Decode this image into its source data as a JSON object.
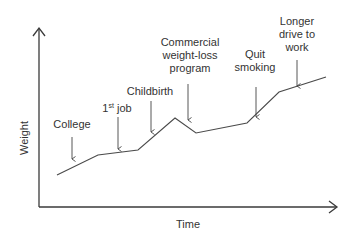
{
  "chart_data": {
    "type": "line",
    "title": "",
    "xlabel": "Time",
    "ylabel": "Weight",
    "grid": false,
    "legend": null,
    "axis_ticks": false,
    "colors": {
      "line": "#4a4a4a",
      "axis": "#3a3a3a",
      "text": "#333333"
    },
    "points": [
      {
        "x": 57,
        "y": 175
      },
      {
        "x": 98,
        "y": 155
      },
      {
        "x": 138,
        "y": 150
      },
      {
        "x": 175,
        "y": 118
      },
      {
        "x": 196,
        "y": 133
      },
      {
        "x": 247,
        "y": 123
      },
      {
        "x": 279,
        "y": 92
      },
      {
        "x": 326,
        "y": 77
      }
    ],
    "annotations": [
      {
        "id": "college",
        "lines": [
          "College"
        ],
        "text_x": 72,
        "text_y": [
          128
        ],
        "arrow_x": 72,
        "arrow_y1": 137,
        "arrow_y2": 160
      },
      {
        "id": "first-job",
        "lines": [
          "1",
          "st",
          " job"
        ],
        "text_x": 117,
        "text_y": [
          112
        ],
        "arrow_x": 118,
        "arrow_y1": 117,
        "arrow_y2": 150,
        "superscript": true
      },
      {
        "id": "childbirth",
        "lines": [
          "Childbirth"
        ],
        "text_x": 150,
        "text_y": [
          95
        ],
        "arrow_x": 151,
        "arrow_y1": 101,
        "arrow_y2": 133
      },
      {
        "id": "commercial-weight-loss",
        "lines": [
          "Commercial",
          "weight-loss",
          "program"
        ],
        "text_x": 190,
        "text_y": [
          46,
          59,
          72
        ],
        "arrow_x": 188,
        "arrow_y1": 84,
        "arrow_y2": 121
      },
      {
        "id": "quit-smoking",
        "lines": [
          "Quit",
          "smoking"
        ],
        "text_x": 255,
        "text_y": [
          58,
          71
        ],
        "arrow_x": 256,
        "arrow_y1": 87,
        "arrow_y2": 118
      },
      {
        "id": "longer-drive",
        "lines": [
          "Longer",
          "drive to",
          "work"
        ],
        "text_x": 297,
        "text_y": [
          25,
          38,
          51
        ],
        "arrow_x": 297,
        "arrow_y1": 60,
        "arrow_y2": 87
      }
    ]
  },
  "labels": {
    "x_axis": "Time",
    "y_axis": "Weight",
    "college": "College",
    "first_job_num": "1",
    "first_job_sup": "st",
    "first_job_rest": " job",
    "childbirth": "Childbirth",
    "commercial_1": "Commercial",
    "commercial_2": "weight-loss",
    "commercial_3": "program",
    "quit_1": "Quit",
    "quit_2": "smoking",
    "longer_1": "Longer",
    "longer_2": "drive to",
    "longer_3": "work"
  }
}
